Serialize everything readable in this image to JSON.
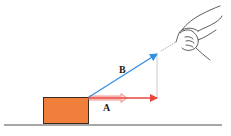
{
  "diagram": {
    "labels": {
      "vector_b": "B",
      "vector_a": "A"
    },
    "colors": {
      "box_fill": "#ef7f3a",
      "box_stroke": "#3a2a20",
      "vector_b": "#2f8fe0",
      "vector_a": "#e8463c",
      "hollow_arrow": "#f08a86",
      "ground": "#8a8a8a",
      "projection_line": "#bdbdbd",
      "hand_stroke": "#333333"
    }
  }
}
